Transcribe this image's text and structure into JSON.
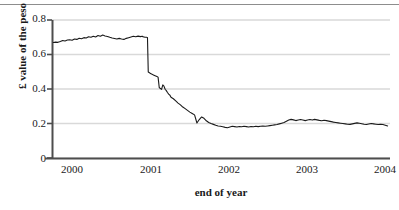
{
  "chart_data": {
    "type": "line",
    "title": "",
    "xlabel": "end of year",
    "ylabel": "£ value of the peso",
    "xlim": [
      1999.78,
      2004.08
    ],
    "ylim": [
      0,
      0.8
    ],
    "yticks": [
      "0",
      "0.2",
      "0.4",
      "0.6",
      "0.8"
    ],
    "ytick_values": [
      0,
      0.2,
      0.4,
      0.6,
      0.8
    ],
    "xticks": [
      "2000",
      "2001",
      "2002",
      "2003",
      "2004"
    ],
    "xtick_values": [
      2000,
      2001,
      2002,
      2003,
      2004
    ],
    "grid": "horizontal",
    "legend": "none",
    "series": [
      {
        "name": "£ value of the peso",
        "color": "#1a1a1a",
        "x": [
          1999.79,
          1999.82,
          1999.85,
          1999.88,
          1999.91,
          1999.94,
          1999.97,
          2000.0,
          2000.03,
          2000.06,
          2000.09,
          2000.12,
          2000.15,
          2000.18,
          2000.21,
          2000.24,
          2000.27,
          2000.3,
          2000.33,
          2000.36,
          2000.39,
          2000.42,
          2000.45,
          2000.48,
          2000.51,
          2000.54,
          2000.57,
          2000.6,
          2000.63,
          2000.66,
          2000.69,
          2000.72,
          2000.75,
          2000.78,
          2000.81,
          2000.84,
          2000.87,
          2000.9,
          2000.925,
          2000.93,
          2000.945,
          2000.96,
          2000.975,
          2000.99,
          2001.0,
          2001.01,
          2001.02,
          2001.035,
          2001.05,
          2001.065,
          2001.08,
          2001.095,
          2001.11,
          2001.125,
          2001.14,
          2001.155,
          2001.17,
          2001.185,
          2001.2,
          2001.215,
          2001.23,
          2001.245,
          2001.26,
          2001.275,
          2001.29,
          2001.32,
          2001.35,
          2001.38,
          2001.41,
          2001.44,
          2001.47,
          2001.5,
          2001.53,
          2001.56,
          2001.59,
          2001.62,
          2001.65,
          2001.68,
          2001.71,
          2001.74,
          2001.77,
          2001.8,
          2001.83,
          2001.86,
          2001.89,
          2001.92,
          2001.95,
          2001.98,
          2002.01,
          2002.04,
          2002.07,
          2002.1,
          2002.13,
          2002.16,
          2002.19,
          2002.22,
          2002.25,
          2002.28,
          2002.31,
          2002.34,
          2002.37,
          2002.4,
          2002.43,
          2002.46,
          2002.49,
          2002.52,
          2002.55,
          2002.58,
          2002.61,
          2002.64,
          2002.67,
          2002.7,
          2002.73,
          2002.76,
          2002.79,
          2002.82,
          2002.85,
          2002.88,
          2002.91,
          2002.94,
          2002.97,
          2003.0,
          2003.03,
          2003.06,
          2003.09,
          2003.12,
          2003.15,
          2003.18,
          2003.21,
          2003.24,
          2003.27,
          2003.3,
          2003.33,
          2003.36,
          2003.39,
          2003.42,
          2003.45,
          2003.48,
          2003.51,
          2003.54,
          2003.57,
          2003.6,
          2003.63,
          2003.66,
          2003.69,
          2003.72,
          2003.75,
          2003.78,
          2003.81,
          2003.84,
          2003.87,
          2003.9,
          2003.93,
          2003.96,
          2003.99,
          2004.02,
          2004.05
        ],
        "y": [
          0.67,
          0.672,
          0.671,
          0.676,
          0.682,
          0.679,
          0.684,
          0.686,
          0.683,
          0.69,
          0.688,
          0.695,
          0.692,
          0.698,
          0.696,
          0.703,
          0.7,
          0.706,
          0.702,
          0.71,
          0.706,
          0.713,
          0.708,
          0.705,
          0.7,
          0.696,
          0.693,
          0.69,
          0.694,
          0.69,
          0.688,
          0.694,
          0.698,
          0.702,
          0.706,
          0.703,
          0.707,
          0.704,
          0.706,
          0.704,
          0.702,
          0.7,
          0.7,
          0.699,
          0.5,
          0.497,
          0.494,
          0.49,
          0.486,
          0.483,
          0.48,
          0.477,
          0.474,
          0.47,
          0.41,
          0.404,
          0.399,
          0.425,
          0.418,
          0.4,
          0.392,
          0.381,
          0.372,
          0.366,
          0.354,
          0.345,
          0.333,
          0.32,
          0.31,
          0.297,
          0.288,
          0.278,
          0.268,
          0.26,
          0.252,
          0.205,
          0.225,
          0.24,
          0.232,
          0.218,
          0.208,
          0.202,
          0.197,
          0.192,
          0.188,
          0.186,
          0.183,
          0.18,
          0.178,
          0.182,
          0.186,
          0.184,
          0.182,
          0.185,
          0.183,
          0.186,
          0.184,
          0.182,
          0.185,
          0.183,
          0.186,
          0.184,
          0.186,
          0.188,
          0.186,
          0.188,
          0.19,
          0.192,
          0.194,
          0.196,
          0.2,
          0.204,
          0.208,
          0.215,
          0.222,
          0.226,
          0.223,
          0.219,
          0.222,
          0.225,
          0.222,
          0.219,
          0.222,
          0.225,
          0.222,
          0.226,
          0.223,
          0.22,
          0.218,
          0.221,
          0.219,
          0.216,
          0.213,
          0.21,
          0.208,
          0.206,
          0.204,
          0.202,
          0.2,
          0.198,
          0.197,
          0.2,
          0.203,
          0.206,
          0.204,
          0.201,
          0.198,
          0.196,
          0.199,
          0.202,
          0.2,
          0.198,
          0.196,
          0.198,
          0.196,
          0.192,
          0.188
        ]
      }
    ]
  },
  "axes": {
    "axis_color": "#4d4d4d",
    "grid_color": "#d9d9d9",
    "line_color": "#1a1a1a"
  }
}
